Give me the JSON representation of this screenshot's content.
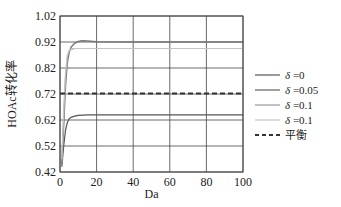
{
  "chart_data": {
    "type": "line",
    "title": "",
    "xlabel": "Da",
    "ylabel": "HOAc转化率",
    "xlim": [
      0,
      100
    ],
    "ylim": [
      0.42,
      1.02
    ],
    "xticks": [
      "0",
      "20",
      "40",
      "60",
      "80",
      "100"
    ],
    "yticks": [
      "0.42",
      "0.52",
      "0.62",
      "0.72",
      "0.82",
      "0.92",
      "1.02"
    ],
    "grid": true,
    "legend_position": "right",
    "series": [
      {
        "name": "δ =0",
        "color": "#555555",
        "width": 1.2,
        "dash": "",
        "x": [
          1,
          2,
          3,
          4,
          5,
          6,
          8,
          10,
          15,
          20,
          40,
          60,
          80,
          100
        ],
        "values": [
          0.44,
          0.52,
          0.58,
          0.61,
          0.625,
          0.63,
          0.635,
          0.638,
          0.64,
          0.64,
          0.64,
          0.64,
          0.64,
          0.64
        ]
      },
      {
        "name": "δ =0.05",
        "color": "#777777",
        "width": 1.4,
        "dash": "",
        "x": [
          1,
          2,
          3,
          4,
          5,
          6,
          8,
          10,
          12,
          15,
          20,
          40,
          60,
          80,
          100
        ],
        "values": [
          0.45,
          0.6,
          0.75,
          0.84,
          0.88,
          0.9,
          0.915,
          0.922,
          0.925,
          0.924,
          0.921,
          0.92,
          0.92,
          0.92,
          0.92
        ]
      },
      {
        "name": "δ =0.1",
        "color": "#999999",
        "width": 1.2,
        "dash": "",
        "x": [
          1,
          2,
          3,
          4,
          5,
          6,
          8,
          10,
          20,
          40,
          60,
          80,
          100
        ],
        "values": [
          0.46,
          0.63,
          0.78,
          0.86,
          0.885,
          0.892,
          0.895,
          0.895,
          0.895,
          0.895,
          0.895,
          0.895,
          0.895
        ]
      },
      {
        "name": "δ =0.1",
        "color": "#c4c4c4",
        "width": 1.2,
        "dash": "",
        "x": [
          1,
          2,
          3,
          4,
          5,
          6,
          8,
          10,
          20,
          40,
          60,
          80,
          100
        ],
        "values": [
          0.47,
          0.66,
          0.8,
          0.87,
          0.888,
          0.893,
          0.895,
          0.895,
          0.895,
          0.895,
          0.895,
          0.895,
          0.895
        ]
      },
      {
        "name": "平衡",
        "color": "#333333",
        "width": 1.8,
        "dash": "5,3",
        "x": [
          0,
          100
        ],
        "values": [
          0.722,
          0.722
        ]
      }
    ]
  }
}
